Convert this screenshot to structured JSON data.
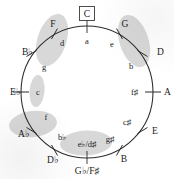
{
  "diagram": {
    "center_key_boxed": "C",
    "colors": {
      "highlight": "#c9c9c9",
      "stroke": "#2b2b2b",
      "text": "#1a1a1a",
      "background": "#ffffff"
    },
    "positions": [
      {
        "major": "C",
        "minor": "a",
        "angle": 0,
        "major_side": "outside",
        "boxed": true
      },
      {
        "major": "G",
        "minor": "e",
        "angle": 30,
        "major_side": "outside",
        "boxed": false
      },
      {
        "major": "D",
        "minor": "b",
        "angle": 60,
        "major_side": "outside",
        "boxed": false
      },
      {
        "major": "A",
        "minor": "f♯",
        "angle": 90,
        "major_side": "outside",
        "boxed": false
      },
      {
        "major": "E",
        "minor": "c♯",
        "angle": 120,
        "major_side": "outside",
        "boxed": false
      },
      {
        "major": "B",
        "minor": "g♯",
        "angle": 150,
        "major_side": "outside",
        "boxed": false
      },
      {
        "major": "G♭/F♯",
        "minor": "e♭/d♯",
        "angle": 180,
        "major_side": "outside",
        "boxed": false
      },
      {
        "major": "D♭",
        "minor": "b♭",
        "angle": 210,
        "major_side": "outside",
        "boxed": false
      },
      {
        "major": "A♭",
        "minor": "f",
        "angle": 240,
        "major_side": "outside",
        "boxed": false
      },
      {
        "major": "E♭",
        "minor": "c",
        "angle": 270,
        "major_side": "outside",
        "boxed": false
      },
      {
        "major": "B♭",
        "minor": "g",
        "angle": 300,
        "major_side": "outside",
        "boxed": false
      },
      {
        "major": "F",
        "minor": "d",
        "angle": 330,
        "major_side": "outside",
        "boxed": false
      }
    ],
    "highlight_groups": [
      {
        "name": "highlight-f-d-g",
        "covers": [
          "F",
          "d",
          "g"
        ]
      },
      {
        "name": "highlight-g-e-d-b",
        "covers": [
          "G",
          "e",
          "D",
          "b"
        ]
      },
      {
        "name": "highlight-c-minor",
        "covers": [
          "c"
        ]
      },
      {
        "name": "highlight-ab-f",
        "covers": [
          "A♭",
          "f"
        ]
      },
      {
        "name": "highlight-bb-eb-d-sharp",
        "covers": [
          "b♭",
          "e♭/d♯"
        ]
      }
    ]
  }
}
